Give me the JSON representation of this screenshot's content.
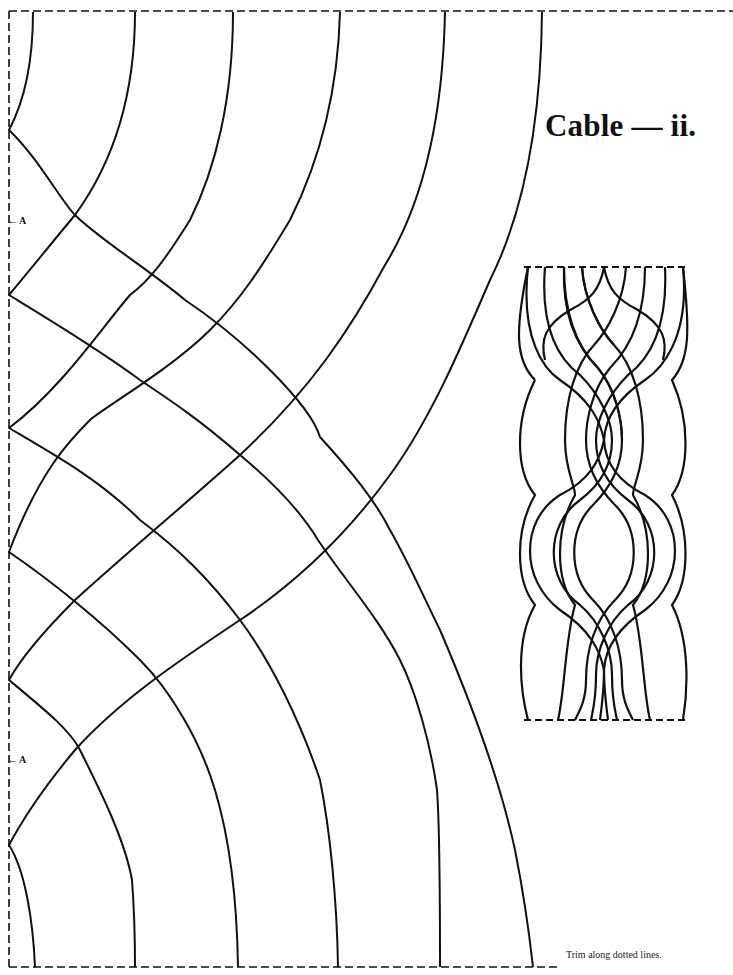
{
  "page": {
    "title": "Cable — ii.",
    "footer_note": "Trim along dotted lines.",
    "ink_color": "#111111",
    "background": "#ffffff"
  },
  "markers": [
    {
      "label": "A",
      "arrow": "←",
      "x": 7,
      "y": 214
    },
    {
      "label": "A",
      "arrow": "←",
      "x": 7,
      "y": 753
    }
  ],
  "trim_border": {
    "left": 9,
    "top": 11,
    "right": 733,
    "bottom": 967,
    "dash": "8 4"
  },
  "template_arcs": {
    "top_start_x": [
      33,
      135,
      233,
      340,
      445,
      542
    ],
    "bottom_end_x": [
      35,
      135,
      238,
      338,
      440,
      541
    ],
    "left_edge_vertices_y": [
      130,
      295,
      428,
      552,
      680,
      845
    ],
    "outer_arc_apex": {
      "x": 387,
      "y": 488
    }
  },
  "preview": {
    "box": {
      "left": 524,
      "top": 267,
      "right": 685,
      "bottom": 720
    },
    "strand_count": 6
  }
}
